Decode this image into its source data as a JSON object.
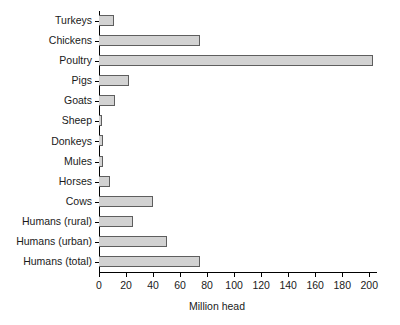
{
  "chart_data": {
    "type": "bar",
    "orientation": "horizontal",
    "title": "",
    "xlabel": "Million head",
    "ylabel": "",
    "xlim": [
      0,
      205
    ],
    "xticks": [
      0,
      20,
      40,
      60,
      80,
      100,
      120,
      140,
      160,
      180,
      200
    ],
    "grid": false,
    "legend": null,
    "bar_fill_color": "#d2d2d2",
    "bar_edge_color": "#5e5e5e",
    "axis_color": "#000000",
    "background_color": "#ffffff",
    "categories": [
      "Turkeys",
      "Chickens",
      "Poultry",
      "Pigs",
      "Goats",
      "Sheep",
      "Donkeys",
      "Mules",
      "Horses",
      "Cows",
      "Humans (rural)",
      "Humans (urban)",
      "Humans (total)"
    ],
    "values": [
      11,
      75,
      203,
      22,
      12,
      2,
      3,
      3,
      8,
      40,
      25,
      50,
      75
    ]
  }
}
